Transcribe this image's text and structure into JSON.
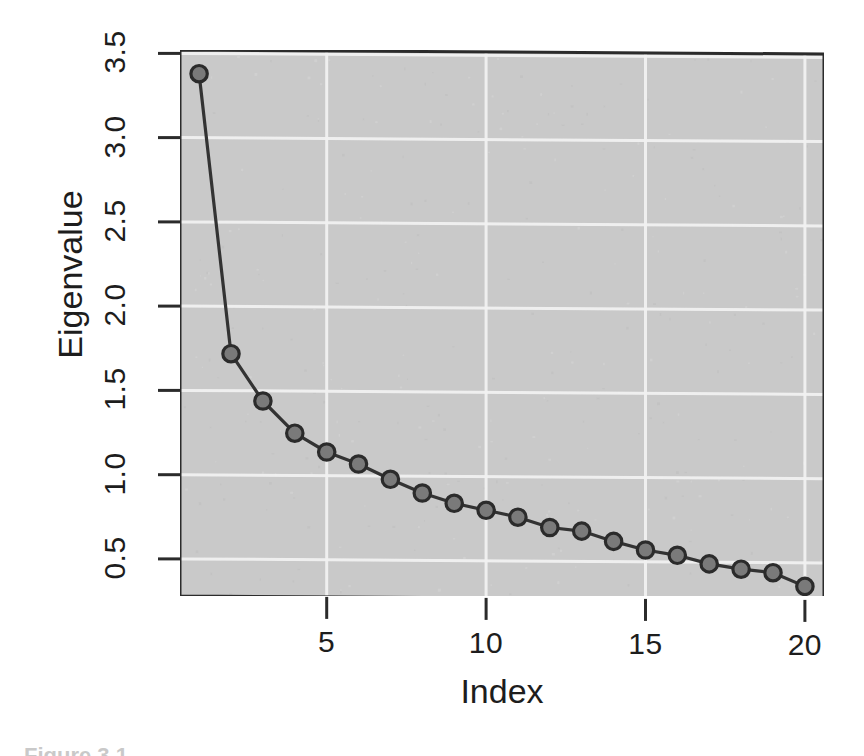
{
  "figure": {
    "caption_fragment": "Figure 3.1"
  },
  "axes": {
    "y_title": "Eigenvalue",
    "x_title": "Index",
    "y_ticks": [
      "0.5",
      "1.0",
      "1.5",
      "2.0",
      "2.5",
      "3.0",
      "3.5"
    ],
    "x_ticks": [
      "5",
      "10",
      "15",
      "20"
    ]
  },
  "style": {
    "panel_background": "#c9c9c9",
    "grid_color": "#f2f2f2",
    "line_color": "#333333",
    "marker_fill": "#7a7a7a",
    "marker_stroke": "#2b2b2b",
    "axis_color": "#2b2b2b"
  },
  "chart_data": {
    "type": "line",
    "title": "",
    "xlabel": "Index",
    "ylabel": "Eigenvalue",
    "xlim": [
      0.4,
      20.6
    ],
    "ylim": [
      0.28,
      3.52
    ],
    "grid": true,
    "legend": "none",
    "markers": "open-circle",
    "x": [
      1,
      2,
      3,
      4,
      5,
      6,
      7,
      8,
      9,
      10,
      11,
      12,
      13,
      14,
      15,
      16,
      17,
      18,
      19,
      20
    ],
    "y": [
      3.38,
      1.72,
      1.44,
      1.25,
      1.14,
      1.07,
      0.98,
      0.9,
      0.84,
      0.8,
      0.76,
      0.7,
      0.68,
      0.62,
      0.57,
      0.54,
      0.49,
      0.46,
      0.44,
      0.36
    ],
    "x_tick_values": [
      5,
      10,
      15,
      20
    ],
    "y_tick_values": [
      0.5,
      1.0,
      1.5,
      2.0,
      2.5,
      3.0,
      3.5
    ],
    "series": [
      {
        "name": "Eigenvalue",
        "values": [
          3.38,
          1.72,
          1.44,
          1.25,
          1.14,
          1.07,
          0.98,
          0.9,
          0.84,
          0.8,
          0.76,
          0.7,
          0.68,
          0.62,
          0.57,
          0.54,
          0.49,
          0.46,
          0.44,
          0.36
        ]
      }
    ]
  }
}
